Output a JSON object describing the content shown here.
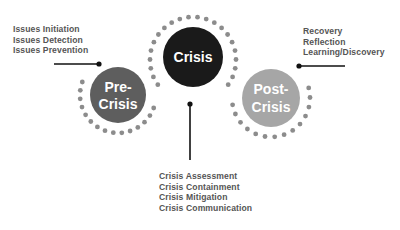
{
  "diagram": {
    "phases": [
      {
        "id": "pre-crisis",
        "lines": [
          "Pre-",
          "Crisis"
        ],
        "fill": "#5e5e5e",
        "activities": [
          "Issues Initiation",
          "Issues Detection",
          "Issues Prevention"
        ]
      },
      {
        "id": "crisis",
        "lines": [
          "Crisis"
        ],
        "fill": "#1a1a1a",
        "activities": [
          "Crisis Assessment",
          "Crisis Containment",
          "Crisis Mitigation",
          "Crisis Communication"
        ]
      },
      {
        "id": "post-crisis",
        "lines": [
          "Post-",
          "Crisis"
        ],
        "fill": "#a6a6a6",
        "activities": [
          "Recovery",
          "Reflection",
          "Learning/Discovery"
        ]
      }
    ],
    "colors": {
      "dots": "#8c8c8c",
      "connector": "#111111",
      "label_text": "#555555",
      "background": "#ffffff"
    }
  }
}
